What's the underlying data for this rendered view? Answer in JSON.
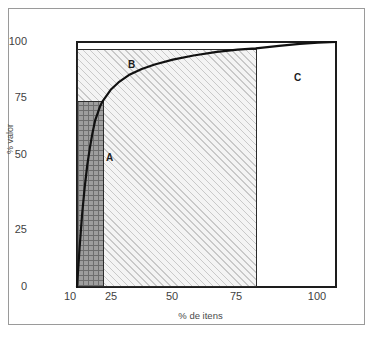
{
  "chart_data": {
    "type": "line",
    "title": "",
    "subtitle": "",
    "xlabel": "% de itens",
    "ylabel": "% valor",
    "xlim": [
      10,
      110
    ],
    "ylim": [
      0,
      100
    ],
    "grid": false,
    "legend_position": "none",
    "xticks": [
      10,
      25,
      50,
      75,
      100
    ],
    "xtick_labels": [
      "10",
      "25",
      "50",
      "75",
      "100"
    ],
    "yticks": [
      0,
      25,
      50,
      75,
      100
    ],
    "ytick_labels": [
      "0",
      "25",
      "50",
      "75",
      "100"
    ],
    "series": [
      {
        "name": "curva de Pareto",
        "x": [
          10,
          11,
          12,
          13,
          14,
          15,
          16,
          17,
          18,
          19,
          20,
          23,
          26,
          30,
          35,
          40,
          47,
          55,
          64,
          72,
          79,
          88,
          96,
          103,
          110
        ],
        "y": [
          0,
          16,
          30,
          41,
          50,
          57,
          63,
          68,
          71,
          74,
          76,
          80.5,
          83.5,
          86.5,
          89,
          90.8,
          92.8,
          94.5,
          96,
          96.9,
          97.4,
          98.4,
          99.2,
          99.7,
          100
        ]
      }
    ],
    "regions": [
      {
        "id": "A",
        "label": "A",
        "x_range": [
          10,
          20
        ],
        "y_range": [
          0,
          76
        ],
        "fill": "dark-crosshatch",
        "color": "#9e9e9e"
      },
      {
        "id": "B",
        "label": "B",
        "x_range": [
          10,
          79
        ],
        "y_range": [
          0,
          97
        ],
        "fill": "light-diagonal-hatch",
        "color": "#f2f2f2"
      },
      {
        "id": "C",
        "label": "C",
        "x_range": [
          79,
          110
        ],
        "y_range": [
          0,
          100
        ],
        "fill": "none",
        "color": "#ffffff"
      }
    ],
    "colors": {
      "axis": "#1d1d1d",
      "curve": "#111111",
      "frame": "#9a9a9a",
      "region_a": "#9e9e9e",
      "region_b": "#f2f2f2",
      "region_c": "#ffffff"
    }
  },
  "axes": {
    "y_label": "% valor",
    "x_label": "% de itens",
    "y_ticks": [
      "100",
      "75",
      "50",
      "25",
      "0"
    ],
    "x_ticks": [
      "10",
      "25",
      "50",
      "75",
      "100"
    ]
  },
  "regions": {
    "a_label": "A",
    "b_label": "B",
    "c_label": "C"
  }
}
